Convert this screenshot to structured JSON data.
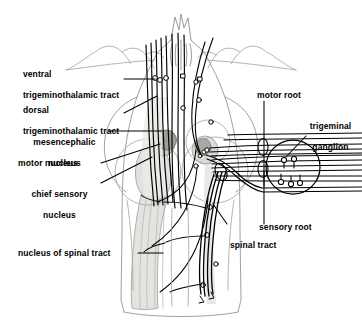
{
  "figure": {
    "type": "anatomical-line-diagram",
    "background_color": "#ffffff",
    "line_color": "#000000",
    "faint_outline_color": "#9a9a9a",
    "shade_light": "#e2e1dd",
    "shade_mid": "#d2d1cc",
    "shade_dark": "#9d9d99"
  },
  "labels": {
    "ventral_tract": "ventral\ntrigeminothalamic tract",
    "ventral_tract_line1": "ventral",
    "ventral_tract_line2": "trigeminothalamic tract",
    "dorsal_tract_line1": "dorsal",
    "dorsal_tract_line2": "trigeminothalamic tract",
    "mesencephalic_line1": "mesencephalic",
    "mesencephalic_line2": "nucleus",
    "motor_nucleus": "motor nucleus",
    "chief_sensory_line1": "chief sensory",
    "chief_sensory_line2": "nucleus",
    "nucleus_of_spinal_tract": "nucleus of spinal tract",
    "motor_root": "motor root",
    "trigeminal_ganglion_line1": "trigeminal",
    "trigeminal_ganglion_line2": "ganglion",
    "sensory_root": "sensory root",
    "spinal_tract": "spinal tract"
  },
  "structures": [
    {
      "name": "cerebellum-outline",
      "side": "top"
    },
    {
      "name": "brainstem-outline",
      "side": "center"
    },
    {
      "name": "mesencephalic-nucleus",
      "shade": "#9d9d99"
    },
    {
      "name": "motor-nucleus",
      "shade": "#c9c8c4"
    },
    {
      "name": "chief-sensory-nucleus",
      "shade": "#e2e1dd"
    },
    {
      "name": "nucleus-of-spinal-tract",
      "shade": "#e2e1dd"
    },
    {
      "name": "trigeminal-ganglion",
      "shade": "#ffffff"
    },
    {
      "name": "ganglion-cell-bodies",
      "count": 5
    },
    {
      "name": "motor-root-fibers"
    },
    {
      "name": "sensory-root-fibers"
    },
    {
      "name": "spinal-tract-fibers"
    }
  ]
}
